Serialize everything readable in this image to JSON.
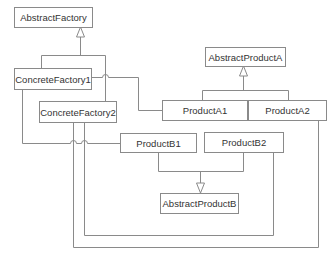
{
  "diagram": {
    "line_color": "#8a8a8a",
    "text_color": "#333333",
    "classes": [
      {
        "id": "abstract-factory",
        "label": "AbstractFactory",
        "x": 14,
        "y": 7,
        "w": 78,
        "h": 20
      },
      {
        "id": "concrete-factory-1",
        "label": "ConcreteFactory1",
        "x": 14,
        "y": 68,
        "w": 77,
        "h": 21
      },
      {
        "id": "concrete-factory-2",
        "label": "ConcreteFactory2",
        "x": 39,
        "y": 101,
        "w": 77,
        "h": 21
      },
      {
        "id": "abstract-product-a",
        "label": "AbstractProductA",
        "x": 205,
        "y": 47,
        "w": 80,
        "h": 19
      },
      {
        "id": "product-a1",
        "label": "ProductA1",
        "x": 162,
        "y": 100,
        "w": 85,
        "h": 20
      },
      {
        "id": "product-a2",
        "label": "ProductA2",
        "x": 248,
        "y": 100,
        "w": 78,
        "h": 20
      },
      {
        "id": "product-b1",
        "label": "ProductB1",
        "x": 120,
        "y": 133,
        "w": 76,
        "h": 19
      },
      {
        "id": "product-b2",
        "label": "ProductB2",
        "x": 204,
        "y": 132,
        "w": 79,
        "h": 20
      },
      {
        "id": "abstract-product-b",
        "label": "AbstractProductB",
        "x": 160,
        "y": 193,
        "w": 78,
        "h": 20
      }
    ],
    "inheritance": [
      {
        "name": "factories-to-abstract-factory",
        "path": "M41.5 68 V55.5 H105.5 V101 M80.5 55.5 V37",
        "arrow_tip": [
          80.5,
          27
        ]
      },
      {
        "name": "products-a-to-abstract-product-a",
        "path": "M202.5 100 V90.5 H288.5 V100 M243.5 90.5 V76",
        "arrow_tip": [
          243.5,
          66
        ]
      },
      {
        "name": "products-b-to-abstract-product-b",
        "path": "M158.5 152 V171.5 H243.5 V152 M200.5 171.5 V183",
        "arrow_tip": [
          200.5,
          193
        ]
      }
    ],
    "dependencies": [
      {
        "name": "cf1-creates-product-a1",
        "path": "M91 77.5 H102.5 A3 3 0 0 1 108.5 77.5 H138.5 V110.5 H162"
      },
      {
        "name": "cf1-creates-product-b1",
        "path": "M22.5 89 V143.5 H70.5 A3 3 0 0 1 76.5 143.5 H81.5 A3 3 0 0 1 87.5 143.5 H120"
      },
      {
        "name": "cf2-creates-product-a2",
        "path": "M73.5 122 V247.5 H318.5 V120"
      },
      {
        "name": "cf2-creates-product-b2",
        "path": "M84.5 122 V235.5 H273.5 V152"
      }
    ]
  }
}
